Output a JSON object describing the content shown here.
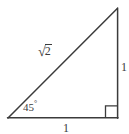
{
  "figure": {
    "background_color": "#ffffff",
    "stroke_color": "#3b3b3b",
    "stroke_width": 1.4,
    "labels": {
      "hypotenuse_radical_sign": "√",
      "hypotenuse_radicand": "2",
      "hypotenuse_full": "√2",
      "vertical_leg": "1",
      "horizontal_leg": "1",
      "angle_value": "45",
      "angle_degree_symbol": "°",
      "angle_full": "45°"
    },
    "geometry": {
      "apex": [
        117,
        8
      ],
      "bottom_left": [
        8,
        118
      ],
      "bottom_right": [
        118,
        118
      ],
      "right_angle_marker_size": 12
    }
  }
}
